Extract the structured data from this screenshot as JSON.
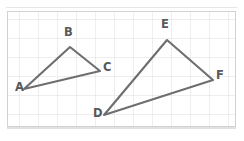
{
  "figure": {
    "background_color": "#ffffff",
    "grid": {
      "cell_size": 19,
      "line_color": "#dcdcdc",
      "minor_line_color": "#eaeaea",
      "origin_x": 7,
      "origin_y": 11,
      "width": 229,
      "height": 116,
      "columns": 12,
      "rows": 6,
      "border_color": "#c9c9c9"
    },
    "stroke_color": "#6e6e70",
    "stroke_width": 2.1,
    "label_color": "#58585a",
    "shapes": [
      {
        "name": "triangle-abc",
        "vertices": [
          {
            "label": "A",
            "x": 24,
            "y": 89,
            "label_x": 15,
            "label_y": 88
          },
          {
            "label": "B",
            "x": 70,
            "y": 47,
            "label_x": 65,
            "label_y": 31
          },
          {
            "label": "C",
            "x": 100,
            "y": 71,
            "label_x": 103,
            "label_y": 66
          }
        ],
        "points": "24,89 70,47 100,71"
      },
      {
        "name": "triangle-def",
        "vertices": [
          {
            "label": "D",
            "x": 104,
            "y": 115,
            "label_x": 94,
            "label_y": 112
          },
          {
            "label": "E",
            "x": 167,
            "y": 40,
            "label_x": 162,
            "label_y": 23
          },
          {
            "label": "F",
            "x": 213,
            "y": 80,
            "label_x": 216,
            "label_y": 74
          }
        ],
        "points": "104,115 167,40 213,80"
      }
    ]
  }
}
